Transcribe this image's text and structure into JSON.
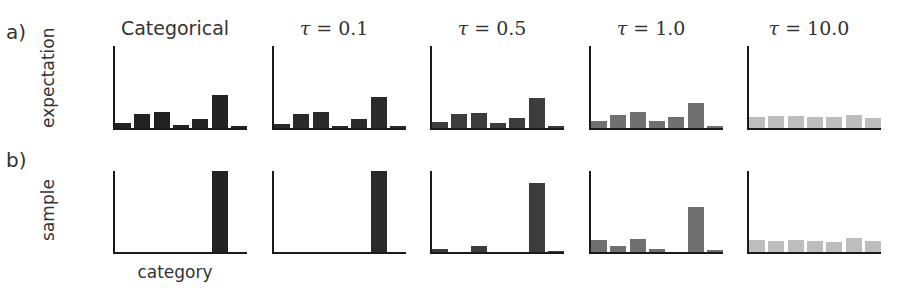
{
  "figure": {
    "row_labels": [
      "a)",
      "b)"
    ],
    "ylabels": [
      "expectation",
      "sample"
    ],
    "xlabel": "category",
    "columns": [
      {
        "title": "Categorical",
        "math": false,
        "tau": null,
        "color": "#222222"
      },
      {
        "title": "τ = 0.1",
        "math": true,
        "tau_symbol": "τ",
        "tau_rest": " = 0.1",
        "color": "#2a2a2a"
      },
      {
        "title": "τ = 0.5",
        "math": true,
        "tau_symbol": "τ",
        "tau_rest": " = 0.5",
        "color": "#3c3c3c"
      },
      {
        "title": "τ = 1.0",
        "math": true,
        "tau_symbol": "τ",
        "tau_rest": " = 1.0",
        "color": "#707070"
      },
      {
        "title": "τ = 10.0",
        "math": true,
        "tau_symbol": "τ",
        "tau_rest": " = 10.0",
        "color": "#bdbdbd"
      }
    ]
  },
  "chart_data": {
    "type": "bar",
    "layout": "grid 2 rows x 5 columns of small-multiple bar charts",
    "categories": [
      "1",
      "2",
      "3",
      "4",
      "5",
      "6",
      "7"
    ],
    "xlabel": "category",
    "row_labels": [
      "a)",
      "b)"
    ],
    "rows": [
      "expectation",
      "sample"
    ],
    "columns": [
      "Categorical",
      "τ = 0.1",
      "τ = 0.5",
      "τ = 1.0",
      "τ = 10.0"
    ],
    "ylim": [
      0,
      1
    ],
    "grid": false,
    "ticks": false,
    "panels": [
      {
        "row": "expectation",
        "column": "Categorical",
        "values": [
          0.06,
          0.17,
          0.2,
          0.04,
          0.11,
          0.4,
          0.02
        ]
      },
      {
        "row": "expectation",
        "column": "τ = 0.1",
        "values": [
          0.05,
          0.17,
          0.2,
          0.03,
          0.11,
          0.38,
          0.02
        ]
      },
      {
        "row": "expectation",
        "column": "τ = 0.5",
        "values": [
          0.07,
          0.17,
          0.18,
          0.06,
          0.12,
          0.36,
          0.03
        ]
      },
      {
        "row": "expectation",
        "column": "τ = 1.0",
        "values": [
          0.09,
          0.16,
          0.2,
          0.08,
          0.13,
          0.31,
          0.03
        ]
      },
      {
        "row": "expectation",
        "column": "τ = 10.0",
        "values": [
          0.13,
          0.15,
          0.15,
          0.13,
          0.14,
          0.16,
          0.12
        ]
      },
      {
        "row": "sample",
        "column": "Categorical",
        "values": [
          0,
          0,
          0,
          0,
          0,
          1.0,
          0
        ]
      },
      {
        "row": "sample",
        "column": "τ = 0.1",
        "values": [
          0,
          0,
          0,
          0,
          0,
          1.0,
          0
        ]
      },
      {
        "row": "sample",
        "column": "τ = 0.5",
        "values": [
          0.04,
          0,
          0.07,
          0,
          0,
          0.85,
          0.01
        ]
      },
      {
        "row": "sample",
        "column": "τ = 1.0",
        "values": [
          0.15,
          0.08,
          0.16,
          0.04,
          0,
          0.55,
          0.03
        ]
      },
      {
        "row": "sample",
        "column": "τ = 10.0",
        "values": [
          0.15,
          0.14,
          0.15,
          0.13,
          0.12,
          0.17,
          0.13
        ]
      }
    ]
  }
}
